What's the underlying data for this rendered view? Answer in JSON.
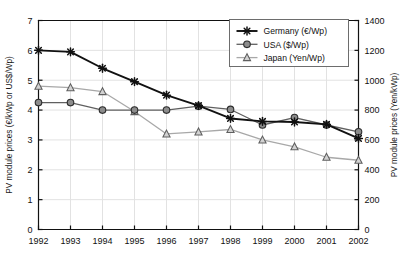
{
  "chart_data": {
    "type": "line",
    "title": "",
    "xlabel": "",
    "ylabel": "PV module prices (€/kWp or US$/Wp)",
    "y2label": "PV module prices (Yen/kWp)",
    "x": [
      1992,
      1993,
      1994,
      1995,
      1996,
      1997,
      1998,
      1999,
      2000,
      2001,
      2002
    ],
    "categories": [
      "1992",
      "1993",
      "1994",
      "1995",
      "1996",
      "1997",
      "1998",
      "1999",
      "2000",
      "2001",
      "2002"
    ],
    "xlim": [
      1992,
      2002
    ],
    "ylim": [
      0,
      7
    ],
    "y2lim": [
      0,
      1400
    ],
    "yticks": [
      "0",
      "1",
      "2",
      "3",
      "4",
      "5",
      "6",
      "7"
    ],
    "ytick_values": [
      0,
      1,
      2,
      3,
      4,
      5,
      6,
      7
    ],
    "y2ticks": [
      "0",
      "200",
      "400",
      "600",
      "800",
      "1000",
      "1200",
      "1400"
    ],
    "y2tick_values": [
      0,
      200,
      400,
      600,
      800,
      1000,
      1200,
      1400
    ],
    "grid": true,
    "legend_position": "top-right",
    "series": [
      {
        "name": "Germany (€/Wp)",
        "axis": "left",
        "marker": "asterisk",
        "color": "#111111",
        "line_width": 1.9,
        "values": [
          6.0,
          5.95,
          5.4,
          4.95,
          4.5,
          4.15,
          3.72,
          3.62,
          3.6,
          3.52,
          3.05
        ]
      },
      {
        "name": "USA ($/Wp)",
        "axis": "left",
        "marker": "circle",
        "color": "#606060",
        "line_width": 1.3,
        "values": [
          4.25,
          4.25,
          4.0,
          4.0,
          4.0,
          4.13,
          4.02,
          3.5,
          3.75,
          3.5,
          3.27
        ]
      },
      {
        "name": "Japan (Yen/Wp)",
        "axis": "right",
        "marker": "triangle",
        "color": "#a8a8a8",
        "line_width": 1.3,
        "values_left_scale": [
          4.8,
          4.75,
          4.62,
          3.95,
          3.2,
          3.27,
          3.35,
          3.0,
          2.77,
          2.42,
          2.32
        ],
        "values": [
          960,
          950,
          924,
          790,
          640,
          654,
          670,
          600,
          554,
          484,
          464
        ]
      }
    ]
  },
  "legend": {
    "entries": [
      {
        "label": "Germany (€/Wp)",
        "marker": "asterisk",
        "color": "#111111"
      },
      {
        "label": "USA ($/Wp)",
        "marker": "circle",
        "color": "#606060"
      },
      {
        "label": "Japan (Yen/Wp)",
        "marker": "triangle",
        "color": "#a8a8a8"
      }
    ]
  },
  "colors": {
    "germany": "#111111",
    "usa": "#606060",
    "japan": "#a8a8a8",
    "grid": "#e2e2e2",
    "axis": "#111111",
    "background": "#ffffff",
    "marker_fill": "#8c8c8c"
  }
}
